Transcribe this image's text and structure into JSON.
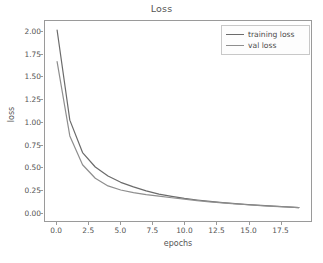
{
  "figure": {
    "background_color": "#ffffff",
    "axes_edge_color": "#9a9a9a",
    "tick_text_color": "#555555"
  },
  "chart_data": {
    "type": "line",
    "title": "Loss",
    "xlabel": "epochs",
    "ylabel": "loss",
    "xlim": [
      -0.95,
      19.95
    ],
    "ylim": [
      -0.099,
      2.12
    ],
    "grid": false,
    "legend_position": "upper right",
    "xticks": [
      "0.0",
      "2.5",
      "5.0",
      "7.5",
      "10.0",
      "12.5",
      "15.0",
      "17.5"
    ],
    "xtick_values": [
      0.0,
      2.5,
      5.0,
      7.5,
      10.0,
      12.5,
      15.0,
      17.5
    ],
    "yticks": [
      "0.00",
      "0.25",
      "0.50",
      "0.75",
      "1.00",
      "1.25",
      "1.50",
      "1.75",
      "2.00"
    ],
    "ytick_values": [
      0.0,
      0.25,
      0.5,
      0.75,
      1.0,
      1.25,
      1.5,
      1.75,
      2.0
    ],
    "x": [
      0,
      1,
      2,
      3,
      4,
      5,
      6,
      7,
      8,
      9,
      10,
      11,
      12,
      13,
      14,
      15,
      16,
      17,
      18,
      19
    ],
    "series": [
      {
        "name": "training loss",
        "color": "#6b6b6b",
        "values": [
          2.02,
          1.02,
          0.66,
          0.5,
          0.4,
          0.33,
          0.28,
          0.235,
          0.2,
          0.175,
          0.152,
          0.134,
          0.118,
          0.105,
          0.093,
          0.083,
          0.074,
          0.066,
          0.058,
          0.05
        ]
      },
      {
        "name": "val loss",
        "color": "#8e8e8e",
        "values": [
          1.67,
          0.845,
          0.525,
          0.375,
          0.29,
          0.245,
          0.215,
          0.193,
          0.176,
          0.159,
          0.143,
          0.128,
          0.114,
          0.102,
          0.091,
          0.081,
          0.072,
          0.064,
          0.057,
          0.05
        ]
      }
    ]
  },
  "legend": {
    "entries": [
      {
        "label": "training loss"
      },
      {
        "label": "val loss"
      }
    ]
  }
}
